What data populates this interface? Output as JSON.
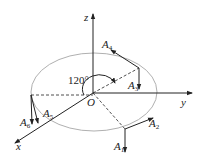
{
  "diagram": {
    "axes": {
      "x": "x",
      "y": "y",
      "z": "z",
      "origin": "O"
    },
    "angle_label": "120°",
    "forces": [
      {
        "name": "A",
        "sub": "1"
      },
      {
        "name": "A",
        "sub": "2"
      },
      {
        "name": "A",
        "sub": "3"
      },
      {
        "name": "A",
        "sub": "4"
      },
      {
        "name": "A",
        "sub": "5"
      },
      {
        "name": "A",
        "sub": "6"
      }
    ],
    "colors": {
      "ellipse": "#b0b0b0",
      "lines": "#222222"
    }
  }
}
